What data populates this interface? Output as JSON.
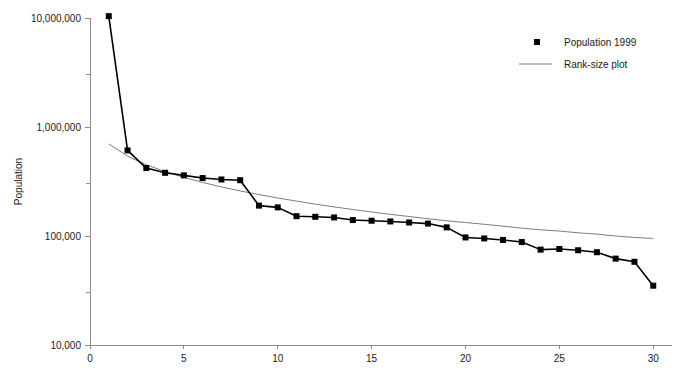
{
  "chart_data": {
    "type": "line",
    "title": "",
    "xlabel": "",
    "ylabel": "Population",
    "xlim": [
      0,
      31
    ],
    "ylim": [
      10000,
      10000000
    ],
    "yscale": "log",
    "grid": false,
    "legend_position": "top-right",
    "xticks": [
      0,
      5,
      10,
      15,
      20,
      25,
      30
    ],
    "xtick_labels": [
      "0",
      "5",
      "10",
      "15",
      "20",
      "25",
      "30"
    ],
    "yticks": [
      10000,
      100000,
      1000000,
      10000000
    ],
    "ytick_labels": [
      "10,000",
      "100,000",
      "1,000,000",
      "10,000,000"
    ],
    "yminor_ticks": [
      30000,
      300000,
      3000000
    ],
    "x": [
      1,
      2,
      3,
      4,
      5,
      6,
      7,
      8,
      9,
      10,
      11,
      12,
      13,
      14,
      15,
      16,
      17,
      18,
      19,
      20,
      21,
      22,
      23,
      24,
      25,
      26,
      27,
      28,
      29,
      30
    ],
    "series": [
      {
        "name": "Population 1999",
        "marker": "square",
        "color": "#000000",
        "values": [
          10400000,
          610000,
          420000,
          380000,
          360000,
          340000,
          330000,
          325000,
          190000,
          183000,
          152000,
          150000,
          148000,
          140000,
          138000,
          136000,
          133000,
          130000,
          120000,
          97000,
          95000,
          92000,
          88000,
          75000,
          76000,
          74000,
          71000,
          62000,
          58000,
          35000
        ]
      },
      {
        "name": "Rank-size plot",
        "marker": "none",
        "color": "#6d6d6d",
        "values": [
          700000,
          540000,
          450000,
          390000,
          345000,
          310000,
          282000,
          259000,
          240000,
          223000,
          209000,
          196000,
          185000,
          175000,
          166000,
          158000,
          151000,
          144000,
          138000,
          133000,
          128000,
          123000,
          118000,
          114000,
          111000,
          107000,
          104000,
          100000,
          97000,
          95000
        ]
      }
    ]
  },
  "legend": {
    "entries": [
      {
        "label": "Population 1999",
        "type": "marker"
      },
      {
        "label": "Rank-size plot",
        "type": "line"
      }
    ]
  }
}
